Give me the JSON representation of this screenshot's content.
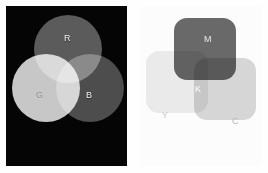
{
  "figure": {
    "kind": "color-model-comparison",
    "rendering": "grayscale",
    "panels": [
      {
        "id": "additive",
        "model": "RGB",
        "mixing": "additive",
        "background_color": "#050505",
        "shape": "circle",
        "shape_count": 3,
        "primaries": [
          {
            "key": "R",
            "label": "R",
            "name": "red",
            "gray_hex": "#585858",
            "cx": 62,
            "cy": 43,
            "r": 34
          },
          {
            "key": "G",
            "label": "G",
            "name": "green",
            "gray_hex": "#c6c6c6",
            "cx": 40,
            "cy": 82,
            "r": 34
          },
          {
            "key": "B",
            "label": "B",
            "name": "blue",
            "gray_hex": "#494949",
            "cx": 84,
            "cy": 82,
            "r": 34
          }
        ],
        "overlaps": [
          {
            "label": "",
            "of": [
              "R",
              "G"
            ],
            "result": "yellow",
            "gray_hex": "#eaeaea"
          },
          {
            "label": "",
            "of": [
              "R",
              "B"
            ],
            "result": "magenta",
            "gray_hex": "#6d6d6d"
          },
          {
            "label": "",
            "of": [
              "G",
              "B"
            ],
            "result": "cyan",
            "gray_hex": "#dcdcdc"
          },
          {
            "label": "",
            "of": [
              "R",
              "G",
              "B"
            ],
            "result": "white",
            "gray_hex": "#fdfdfd"
          }
        ]
      },
      {
        "id": "subtractive",
        "model": "CMYK",
        "mixing": "subtractive",
        "background_color": "#fcfcfc",
        "shape": "rounded-square",
        "shape_count": 3,
        "primaries": [
          {
            "key": "M",
            "label": "M",
            "name": "magenta",
            "gray_hex": "#6a6a6a",
            "x": 34,
            "y": 12,
            "size": 62
          },
          {
            "key": "Y",
            "label": "Y",
            "name": "yellow",
            "gray_hex": "#ededed",
            "x": 6,
            "y": 45,
            "size": 62
          },
          {
            "key": "C",
            "label": "C",
            "name": "cyan",
            "gray_hex": "#d9d9d9",
            "x": 54,
            "y": 52,
            "size": 62
          }
        ],
        "overlaps": [
          {
            "label": "",
            "of": [
              "M",
              "Y"
            ],
            "result": "red",
            "gray_hex": "#3e3e3e"
          },
          {
            "label": "",
            "of": [
              "M",
              "C"
            ],
            "result": "blue",
            "gray_hex": "#5b5b5b"
          },
          {
            "label": "",
            "of": [
              "Y",
              "C"
            ],
            "result": "green",
            "gray_hex": "#c8c8c8"
          },
          {
            "label": "K",
            "of": [
              "C",
              "M",
              "Y"
            ],
            "result": "black",
            "gray_hex": "#0b0b0b"
          }
        ]
      }
    ]
  }
}
